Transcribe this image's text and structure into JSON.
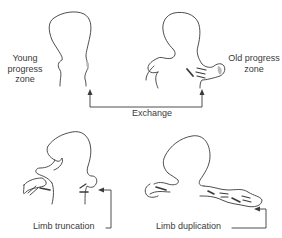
{
  "labels": {
    "young_progress_zone": "Young progress zone",
    "old_progress_zone": "Old progress zone",
    "exchange": "Exchange",
    "limb_truncation": "Limb truncation",
    "limb_duplication": "Limb duplication"
  },
  "colors": {
    "line": "#3a3a3a",
    "zone_fill": "#b8b8b8",
    "background": "#ffffff"
  },
  "panels": [
    {
      "id": "young-bud",
      "position": "top-left",
      "label": "Young progress zone"
    },
    {
      "id": "old-bud",
      "position": "top-right",
      "label": "Old progress zone"
    },
    {
      "id": "truncated-limb-embryo",
      "position": "bottom-left",
      "label": "Limb truncation"
    },
    {
      "id": "duplicated-limb-embryo",
      "position": "bottom-right",
      "label": "Limb duplication"
    }
  ]
}
